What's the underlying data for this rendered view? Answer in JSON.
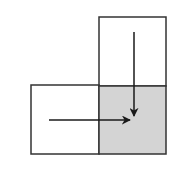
{
  "diagram": {
    "colors": {
      "background": "#ffffff",
      "stroke": "#333333",
      "shaded_fill": "#d4d4d4",
      "arrow": "#1a1a1a"
    },
    "cells": [
      {
        "name": "top-cell",
        "x": 99,
        "y": 17,
        "w": 67,
        "h": 69,
        "shaded": false
      },
      {
        "name": "left-cell",
        "x": 31,
        "y": 85,
        "w": 68,
        "h": 69,
        "shaded": false
      },
      {
        "name": "target-cell",
        "x": 99,
        "y": 86,
        "w": 67,
        "h": 68,
        "shaded": true
      }
    ],
    "arrows": [
      {
        "name": "down-arrow",
        "x1": 134,
        "y1": 32,
        "x2": 134,
        "y2": 116
      },
      {
        "name": "right-arrow",
        "x1": 49,
        "y1": 120,
        "x2": 130,
        "y2": 120
      }
    ]
  }
}
